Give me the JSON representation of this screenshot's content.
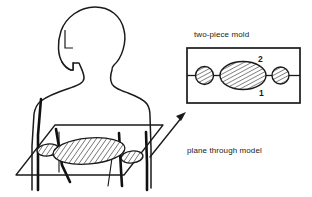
{
  "diagram": {
    "title_visible": false,
    "labels": {
      "mold_caption": "two-piece mold",
      "plane_caption": "plane through model",
      "mold_half_upper": "2",
      "mold_half_lower": "1",
      "head_ear_mark": "L"
    },
    "colors": {
      "ink": "#1a1a1a",
      "heavy_ink": "#111111",
      "paper": "#ffffff",
      "hatch": "#1a1a1a"
    },
    "figure": {
      "name": "human-bust-model",
      "parts": [
        "head",
        "neck",
        "shoulders",
        "torso",
        "left-arm",
        "right-arm"
      ]
    },
    "cutting_plane": {
      "name": "horizontal-section-plane",
      "cross_sections": [
        {
          "name": "left-arm-section",
          "shape": "ellipse",
          "hatched": true
        },
        {
          "name": "torso-section",
          "shape": "ellipse",
          "hatched": true
        },
        {
          "name": "right-arm-section",
          "shape": "ellipse",
          "hatched": true
        }
      ]
    },
    "mold_detail": {
      "name": "two-piece-mold-section",
      "box": {
        "stroke": "#1a1a1a"
      },
      "parting_line": true,
      "cavities": [
        {
          "name": "left-arm-cavity",
          "shape": "circle",
          "hatched": true
        },
        {
          "name": "torso-cavity",
          "shape": "ellipse",
          "hatched": true
        },
        {
          "name": "right-arm-cavity",
          "shape": "circle",
          "hatched": true
        }
      ],
      "half_labels": {
        "upper": "2",
        "lower": "1"
      }
    },
    "pointer": {
      "name": "plane-to-mold-arrow",
      "direction": "up-right"
    }
  }
}
